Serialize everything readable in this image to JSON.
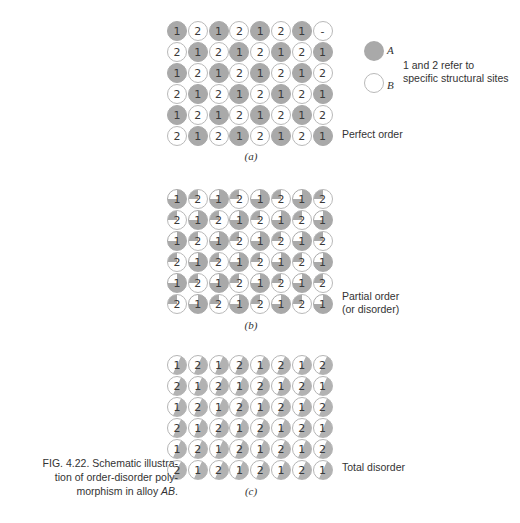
{
  "figure": {
    "caption_line1": "FIG. 4.22. Schematic illustra-",
    "caption_line2": "tion of order-disorder poly-",
    "caption_line3_prefix": "morphism in alloy ",
    "caption_line3_alloy": "AB",
    "caption_line3_suffix": "."
  },
  "legend": {
    "a_label": "A",
    "b_label": "B",
    "note_line1": "1 and 2 refer to",
    "note_line2": "specific structural sites",
    "colors": {
      "A": "#a9a9a9",
      "B": "#ffffff"
    }
  },
  "panels": [
    {
      "id": "a",
      "label": "(a)",
      "state_line1": "Perfect order",
      "state_line2": "",
      "fill": "site1=A full, site2=B full",
      "rows": [
        [
          "1",
          "2",
          "1",
          "2",
          "1",
          "2",
          "1",
          "-"
        ],
        [
          "2",
          "1",
          "2",
          "1",
          "2",
          "1",
          "2",
          "1"
        ],
        [
          "1",
          "2",
          "1",
          "2",
          "1",
          "2",
          "1",
          "2"
        ],
        [
          "2",
          "1",
          "2",
          "1",
          "2",
          "1",
          "2",
          "1"
        ],
        [
          "1",
          "2",
          "1",
          "2",
          "1",
          "2",
          "1",
          "2"
        ],
        [
          "2",
          "1",
          "2",
          "1",
          "2",
          "1",
          "2",
          "1"
        ]
      ]
    },
    {
      "id": "b",
      "label": "(b)",
      "state_line1": "Partial order",
      "state_line2": "(or disorder)",
      "fill": "site1=3/4 A, site2=3/4 B",
      "rows": [
        [
          "1",
          "2",
          "1",
          "2",
          "1",
          "2",
          "1",
          "2"
        ],
        [
          "2",
          "1",
          "2",
          "1",
          "2",
          "1",
          "2",
          "1"
        ],
        [
          "1",
          "2",
          "1",
          "2",
          "1",
          "2",
          "1",
          "2"
        ],
        [
          "2",
          "1",
          "2",
          "1",
          "2",
          "1",
          "2",
          "1"
        ],
        [
          "1",
          "2",
          "1",
          "2",
          "1",
          "2",
          "1",
          "2"
        ],
        [
          "2",
          "1",
          "2",
          "1",
          "2",
          "1",
          "2",
          "1"
        ]
      ]
    },
    {
      "id": "c",
      "label": "(c)",
      "state_line1": "Total disorder",
      "state_line2": "",
      "fill": "all sites 1/2 A, 1/2 B",
      "rows": [
        [
          "1",
          "2",
          "1",
          "2",
          "1",
          "2",
          "1",
          "2"
        ],
        [
          "2",
          "1",
          "2",
          "1",
          "2",
          "1",
          "2",
          "1"
        ],
        [
          "1",
          "2",
          "1",
          "2",
          "1",
          "2",
          "1",
          "2"
        ],
        [
          "2",
          "1",
          "2",
          "1",
          "2",
          "1",
          "2",
          "1"
        ],
        [
          "1",
          "2",
          "1",
          "2",
          "1",
          "2",
          "1",
          "2"
        ],
        [
          "2",
          "1",
          "2",
          "1",
          "2",
          "1",
          "2",
          "1"
        ]
      ]
    }
  ]
}
